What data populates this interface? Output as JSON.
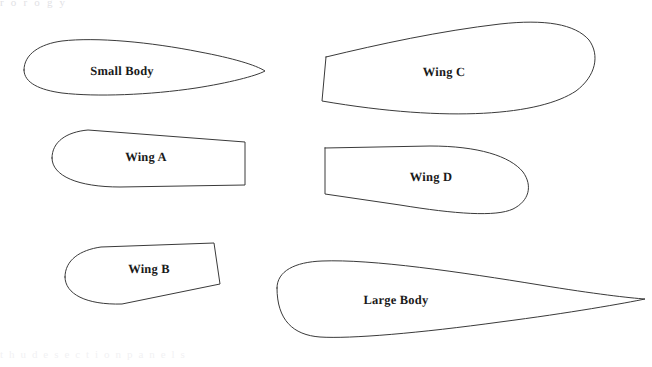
{
  "page": {
    "width": 652,
    "height": 367,
    "background_color": "#ffffff",
    "stroke_color": "#3a3a3a",
    "label_color": "#1a1a1a"
  },
  "artifacts": {
    "top_ghost_text": "r o r   o   g         y",
    "bottom_ghost_text": "t   h   u d e   s e c t i o n   p a n e l s"
  },
  "shapes": [
    {
      "id": "small-body",
      "label": "Small Body",
      "label_x": 122,
      "label_y": 71,
      "type": "airfoil",
      "path": "M 24 70 C 24 54, 40 44, 62 41 C 96 37, 150 42, 200 52 C 232 58, 256 65, 265 71 C 256 76, 228 83, 196 88 C 150 95, 96 97, 62 93 C 40 90, 24 83, 24 70 Z"
    },
    {
      "id": "wing-a",
      "label": "Wing A",
      "label_x": 146,
      "label_y": 157,
      "type": "rounded-panel",
      "path": "M 52 158 C 52 142, 66 132, 88 130 L 245 142 L 245 185 L 120 187 C 78 187, 52 176, 52 158 Z"
    },
    {
      "id": "wing-b",
      "label": "Wing B",
      "label_x": 149,
      "label_y": 269,
      "type": "rounded-panel",
      "path": "M 65 277 C 65 260, 80 250, 101 247 L 214 243 L 220 284 L 122 304 C 86 305, 65 294, 65 277 Z"
    },
    {
      "id": "wing-c",
      "label": "Wing C",
      "label_x": 444,
      "label_y": 72,
      "type": "swept-panel",
      "path": "M 326 57 C 380 44, 440 31, 500 24 C 545 19, 575 24, 589 40 C 600 55, 596 76, 576 91 C 540 115, 450 123, 322 101 L 326 57 Z"
    },
    {
      "id": "wing-d",
      "label": "Wing D",
      "label_x": 431,
      "label_y": 177,
      "type": "rounded-panel",
      "path": "M 325 148 L 430 146 C 478 146, 510 156, 523 172 C 533 186, 529 201, 513 209 C 496 217, 455 214, 400 205 L 325 194 L 325 148 Z"
    },
    {
      "id": "large-body",
      "label": "Large Body",
      "label_x": 396,
      "label_y": 300,
      "type": "airfoil",
      "path": "M 277 288 C 277 271, 295 262, 322 261 C 372 259, 460 272, 540 285 C 595 294, 630 298, 645 299 C 626 303, 570 313, 500 322 C 420 333, 350 339, 320 337 C 293 335, 277 320, 277 288 Z"
    }
  ]
}
